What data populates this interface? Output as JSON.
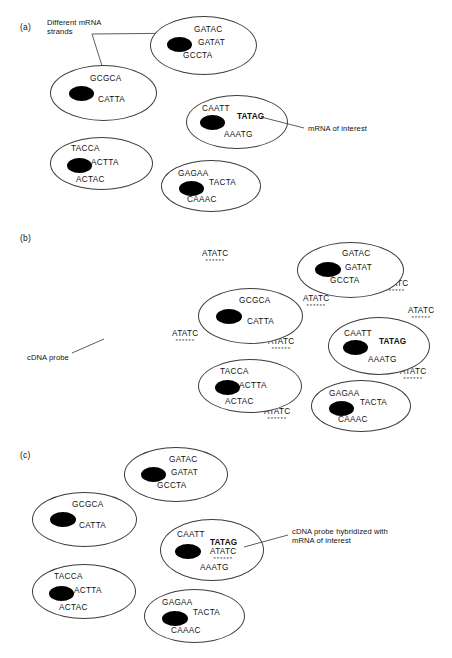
{
  "figure": {
    "type": "diagram",
    "panels": [
      {
        "id": "a",
        "label": "(a)",
        "annotations": [
          {
            "name": "different-mrna-strands",
            "lines": [
              "Different mRNA",
              "strands"
            ]
          },
          {
            "name": "mrna-of-interest",
            "lines": [
              "mRNA of interest"
            ]
          }
        ],
        "cells": [
          {
            "name": "cell-gatac",
            "sequences": [
              "GATAC",
              "GATAT",
              "GCCTA"
            ],
            "highlight": null
          },
          {
            "name": "cell-gcgca",
            "sequences": [
              "GCGCA",
              "CATTA"
            ],
            "highlight": null
          },
          {
            "name": "cell-caatt",
            "sequences": [
              "CAATT",
              "TATAG",
              "AAATG"
            ],
            "highlight": "TATAG"
          },
          {
            "name": "cell-tacca",
            "sequences": [
              "TACCA",
              "ACTTA",
              "ACTAC"
            ],
            "highlight": null
          },
          {
            "name": "cell-gagaa",
            "sequences": [
              "GAGAA",
              "TACTA",
              "CAAAC"
            ],
            "highlight": null
          }
        ]
      },
      {
        "id": "b",
        "label": "(b)",
        "annotations": [
          {
            "name": "cdna-probe",
            "lines": [
              "cDNA probe"
            ]
          }
        ],
        "probe": {
          "sequence": "ATATC",
          "stars": "******",
          "count": 9
        },
        "cells": [
          {
            "name": "cell-gatac",
            "sequences": [
              "GATAC",
              "GATAT",
              "GCCTA"
            ],
            "highlight": null
          },
          {
            "name": "cell-gcgca",
            "sequences": [
              "GCGCA",
              "CATTA"
            ],
            "highlight": null
          },
          {
            "name": "cell-caatt",
            "sequences": [
              "CAATT",
              "TATAG",
              "AAATG"
            ],
            "highlight": "TATAG"
          },
          {
            "name": "cell-tacca",
            "sequences": [
              "TACCA",
              "ACTTA",
              "ACTAC"
            ],
            "highlight": null
          },
          {
            "name": "cell-gagaa",
            "sequences": [
              "GAGAA",
              "TACTA",
              "CAAAC"
            ],
            "highlight": null
          }
        ]
      },
      {
        "id": "c",
        "label": "(c)",
        "annotations": [
          {
            "name": "cdna-probe-hybridized",
            "lines": [
              "cDNA probe hybridized with",
              "mRNA of interest"
            ]
          }
        ],
        "probe": {
          "sequence": "ATATC",
          "stars": "******"
        },
        "cells": [
          {
            "name": "cell-gatac",
            "sequences": [
              "GATAC",
              "GATAT",
              "GCCTA"
            ],
            "highlight": null
          },
          {
            "name": "cell-gcgca",
            "sequences": [
              "GCGCA",
              "CATTA"
            ],
            "highlight": null
          },
          {
            "name": "cell-caatt",
            "sequences": [
              "CAATT",
              "TATAG",
              "ATATC",
              "AAATG"
            ],
            "highlight": "TATAG"
          },
          {
            "name": "cell-tacca",
            "sequences": [
              "TACCA",
              "ACTTA",
              "ACTAC"
            ],
            "highlight": null
          },
          {
            "name": "cell-gagaa",
            "sequences": [
              "GAGAA",
              "TACTA",
              "CAAAC"
            ],
            "highlight": null
          }
        ]
      }
    ],
    "colors": {
      "outline": "#3c3c3c",
      "nucleus": "#000000",
      "text": "#111111",
      "background": "#ffffff"
    }
  }
}
